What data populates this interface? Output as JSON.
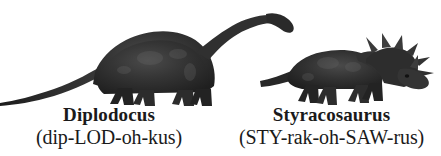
{
  "page": {
    "background_color": "#ffffff",
    "ink_color": "#1a1a1a"
  },
  "entries": [
    {
      "id": "diplodocus",
      "name": "Diplodocus",
      "pronunciation": "(dip-LOD-oh-kus)",
      "illustration": "diplodocus-silhouette",
      "silhouette_color": "#2b2b2b"
    },
    {
      "id": "styracosaurus",
      "name": "Styracosaurus",
      "pronunciation": "(STY-rak-oh-SAW-rus)",
      "illustration": "styracosaurus-silhouette",
      "silhouette_color": "#2b2b2b"
    }
  ]
}
